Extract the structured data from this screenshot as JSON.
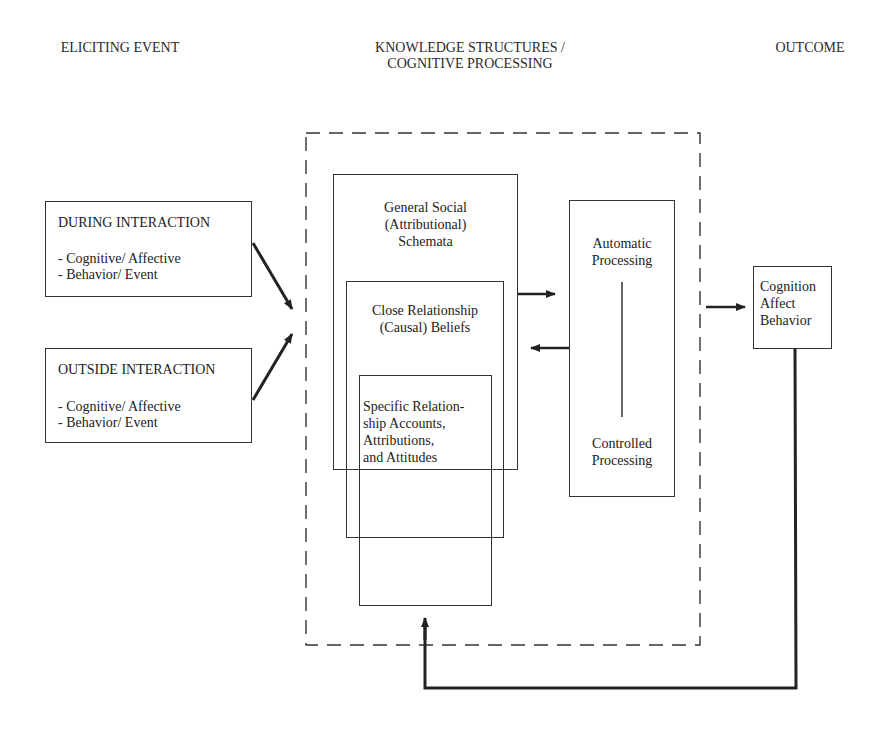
{
  "headers": {
    "eliciting": "ELICITING EVENT",
    "knowledge_line1": "KNOWLEDGE STRUCTURES /",
    "knowledge_line2": "COGNITIVE PROCESSING",
    "outcome": "OUTCOME"
  },
  "eliciting_events": [
    {
      "title": "DURING INTERACTION",
      "items": [
        "- Cognitive/ Affective",
        "- Behavior/ Event"
      ]
    },
    {
      "title": "OUTSIDE INTERACTION",
      "items": [
        "- Cognitive/ Affective",
        "- Behavior/ Event"
      ]
    }
  ],
  "knowledge_structures": {
    "general": [
      "General Social",
      "(Attributional)",
      "Schemata"
    ],
    "close": [
      "Close Relationship",
      "(Causal) Beliefs"
    ],
    "specific": [
      "Specific Relation-",
      "ship Accounts,",
      "Attributions,",
      "and Attitudes"
    ]
  },
  "processing": {
    "top": [
      "Automatic",
      "Processing"
    ],
    "bottom": [
      "Controlled",
      "Processing"
    ]
  },
  "outcome": [
    "Cognition",
    "Affect",
    "Behavior"
  ],
  "colors": {
    "line": "#222222",
    "text": "#222222",
    "background": "#ffffff"
  }
}
